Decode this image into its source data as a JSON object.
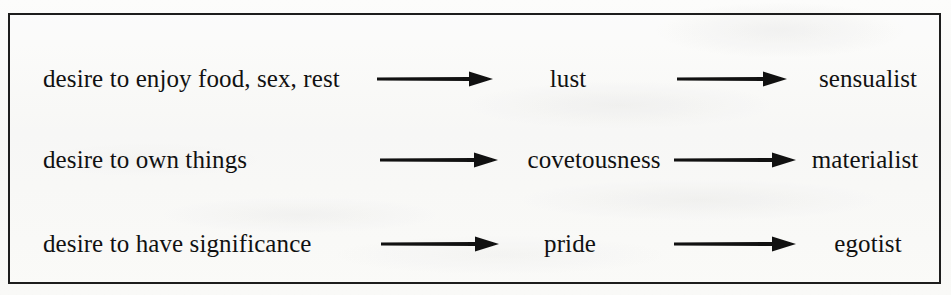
{
  "figure": {
    "type": "diagram",
    "kind": "three-column flow diagram",
    "background_color": "#fbfbfa",
    "ink_color": "#111111",
    "border_color": "#1d1d1d",
    "columns": [
      "desire",
      "sin",
      "character type"
    ],
    "rows": [
      {
        "source": "desire to enjoy food, sex, rest",
        "arrow_1": "right-arrow",
        "middle": "lust",
        "arrow_2": "right-arrow",
        "target": "sensualist"
      },
      {
        "source": "desire to own things",
        "arrow_1": "right-arrow",
        "middle": "covetousness",
        "arrow_2": "right-arrow",
        "target": "materialist"
      },
      {
        "source": "desire to have significance",
        "arrow_1": "right-arrow",
        "middle": "pride",
        "arrow_2": "right-arrow",
        "target": "egotist"
      }
    ]
  }
}
